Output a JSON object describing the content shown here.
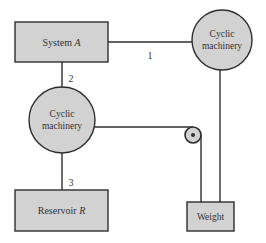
{
  "diagram": {
    "colors": {
      "fill": "#d2d2d2",
      "stroke": "#2e2e2e",
      "text": "#333333",
      "background": "#ffffff"
    },
    "nodes": {
      "system_a": {
        "label_main": "System ",
        "label_var": "A"
      },
      "cyclic_top": {
        "line1": "Cyclic",
        "line2": "machinery"
      },
      "cyclic_mid": {
        "line1": "Cyclic",
        "line2": "machinery"
      },
      "reservoir_r": {
        "label_main": "Reservoir ",
        "label_var": "R"
      },
      "weight": {
        "label": "Weight"
      },
      "pulley": {
        "label": ""
      }
    },
    "edges": {
      "e1": {
        "label": "1",
        "from": "System A",
        "to": "Cyclic machinery (top)"
      },
      "e2": {
        "label": "2",
        "from": "System A",
        "to": "Cyclic machinery (middle)"
      },
      "e3": {
        "label": "3",
        "from": "Cyclic machinery (middle)",
        "to": "Reservoir R"
      },
      "e4": {
        "label": "",
        "from": "Cyclic machinery (top)",
        "to": "Weight"
      },
      "e5": {
        "label": "",
        "from": "Cyclic machinery (middle)",
        "to": "Weight",
        "via": "pulley"
      }
    }
  }
}
